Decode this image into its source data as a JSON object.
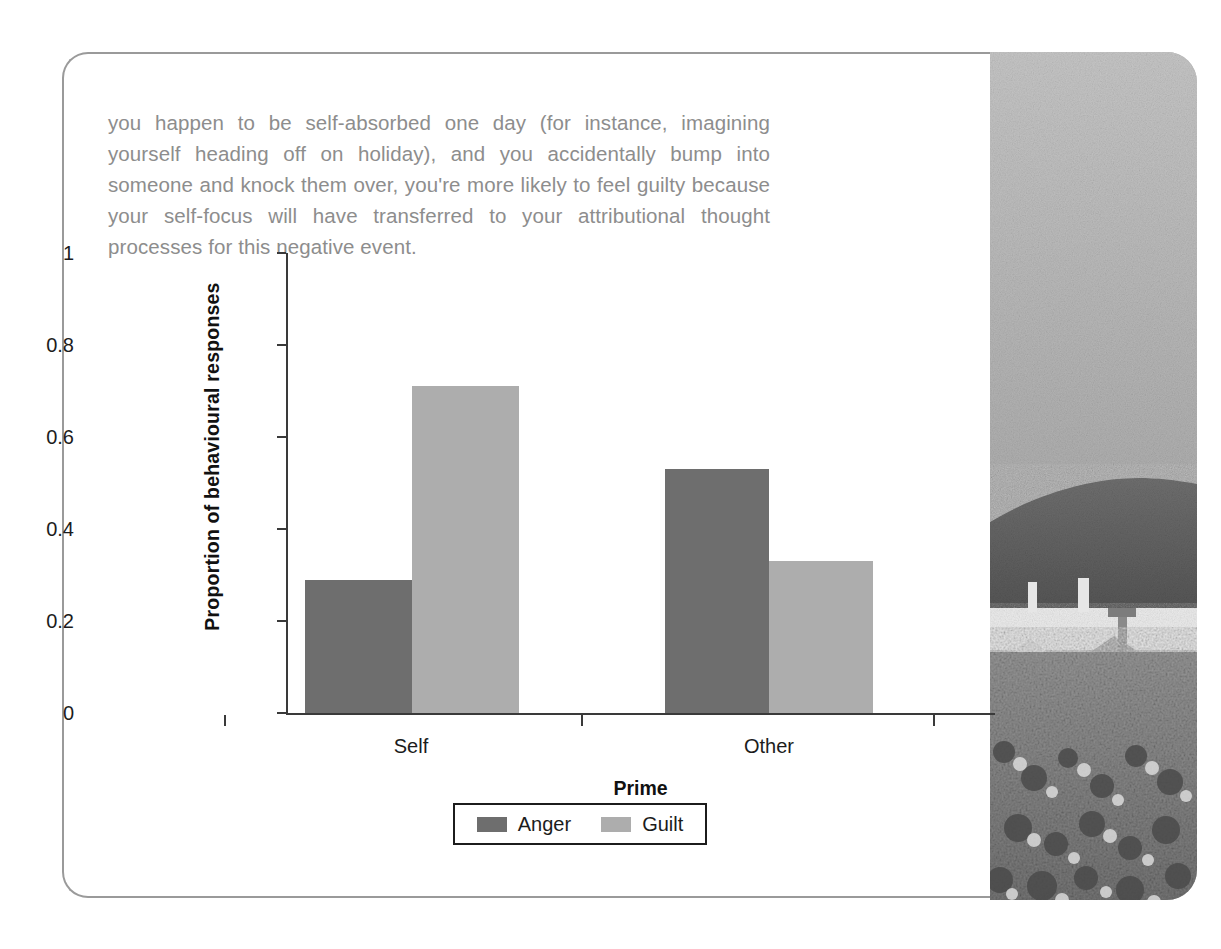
{
  "page": {
    "body_text": "you happen to be self-absorbed one day (for instance, imagining yourself heading off on holiday), and you accidentally bump into someone and knock them over, you're more likely to feel guilty because your self-focus will have transferred to your attributional thought processes for this negative event.",
    "frame_border_color": "#9a9a9a"
  },
  "photo": {
    "caption": "grayscale photograph of a crowd at an outdoor festival with a parachute canopy, rooftops and hills under a pale sky"
  },
  "chart_data": {
    "type": "bar",
    "title": "",
    "xlabel": "Prime",
    "ylabel": "Proportion of behavioural responses",
    "categories": [
      "Self",
      "Other"
    ],
    "series": [
      {
        "name": "Anger",
        "values": [
          0.29,
          0.53
        ],
        "color": "#6e6e6e"
      },
      {
        "name": "Guilt",
        "values": [
          0.71,
          0.33
        ],
        "color": "#adadad"
      }
    ],
    "ylim": [
      0,
      1
    ],
    "yticks": [
      "0",
      "0.2",
      "0.4",
      "0.6",
      "0.8",
      "1"
    ],
    "ytick_values": [
      0,
      0.2,
      0.4,
      0.6,
      0.8,
      1
    ],
    "grid": false,
    "legend_position": "bottom",
    "legend_entries": [
      "Anger",
      "Guilt"
    ]
  }
}
